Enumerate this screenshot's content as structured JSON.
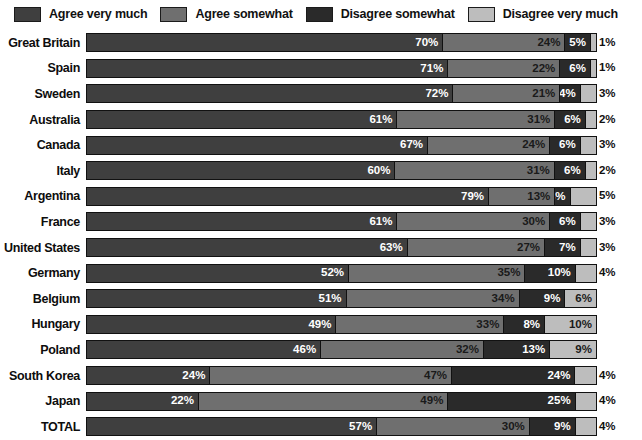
{
  "legend": {
    "items": [
      {
        "label": "Agree very much",
        "color": "#3f3f3f"
      },
      {
        "label": "Agree somewhat",
        "color": "#6f6f6f"
      },
      {
        "label": "Disagree somewhat",
        "color": "#2a2a2a"
      },
      {
        "label": "Disagree very much",
        "color": "#bdbdbd"
      }
    ]
  },
  "chart_data": {
    "type": "bar",
    "subtype": "stacked-horizontal-100",
    "title": "",
    "xlabel": "",
    "ylabel": "",
    "xlim": [
      0,
      100
    ],
    "grid": false,
    "legend_position": "top",
    "value_suffix": "%",
    "categories": [
      "Great Britain",
      "Spain",
      "Sweden",
      "Australia",
      "Canada",
      "Italy",
      "Argentina",
      "France",
      "United States",
      "Germany",
      "Belgium",
      "Hungary",
      "Poland",
      "South Korea",
      "Japan",
      "TOTAL"
    ],
    "series": [
      {
        "name": "Agree very much",
        "color": "#3f3f3f",
        "values": [
          70,
          71,
          72,
          61,
          67,
          60,
          79,
          61,
          63,
          52,
          51,
          49,
          46,
          24,
          22,
          57
        ]
      },
      {
        "name": "Agree somewhat",
        "color": "#6f6f6f",
        "values": [
          24,
          22,
          21,
          31,
          24,
          31,
          13,
          30,
          27,
          35,
          34,
          33,
          32,
          47,
          49,
          30
        ]
      },
      {
        "name": "Disagree somewhat",
        "color": "#2a2a2a",
        "values": [
          5,
          6,
          4,
          6,
          6,
          6,
          3,
          6,
          7,
          10,
          9,
          8,
          13,
          24,
          25,
          9
        ]
      },
      {
        "name": "Disagree very much",
        "color": "#bdbdbd",
        "values": [
          1,
          1,
          3,
          2,
          3,
          2,
          5,
          3,
          3,
          4,
          6,
          10,
          9,
          4,
          4,
          4
        ]
      }
    ],
    "labels": [
      {
        "category": "Great Britain",
        "values": [
          "70%",
          "24%",
          "5%",
          "1%"
        ],
        "outside": [
          false,
          false,
          false,
          true
        ]
      },
      {
        "category": "Spain",
        "values": [
          "71%",
          "22%",
          "6%",
          "1%"
        ],
        "outside": [
          false,
          false,
          false,
          true
        ]
      },
      {
        "category": "Sweden",
        "values": [
          "72%",
          "21%",
          "4%",
          "3%"
        ],
        "outside": [
          false,
          false,
          false,
          true
        ]
      },
      {
        "category": "Australia",
        "values": [
          "61%",
          "31%",
          "6%",
          "2%"
        ],
        "outside": [
          false,
          false,
          false,
          true
        ]
      },
      {
        "category": "Canada",
        "values": [
          "67%",
          "24%",
          "6%",
          "3%"
        ],
        "outside": [
          false,
          false,
          false,
          true
        ]
      },
      {
        "category": "Italy",
        "values": [
          "60%",
          "31%",
          "6%",
          "2%"
        ],
        "outside": [
          false,
          false,
          false,
          true
        ]
      },
      {
        "category": "Argentina",
        "values": [
          "79%",
          "13%",
          "3%",
          "5%"
        ],
        "outside": [
          false,
          false,
          false,
          true
        ]
      },
      {
        "category": "France",
        "values": [
          "61%",
          "30%",
          "6%",
          "3%"
        ],
        "outside": [
          false,
          false,
          false,
          true
        ]
      },
      {
        "category": "United States",
        "values": [
          "63%",
          "27%",
          "7%",
          "3%"
        ],
        "outside": [
          false,
          false,
          false,
          true
        ]
      },
      {
        "category": "Germany",
        "values": [
          "52%",
          "35%",
          "10%",
          "4%"
        ],
        "outside": [
          false,
          false,
          false,
          true
        ]
      },
      {
        "category": "Belgium",
        "values": [
          "51%",
          "34%",
          "9%",
          "6%"
        ],
        "outside": [
          false,
          false,
          false,
          false
        ]
      },
      {
        "category": "Hungary",
        "values": [
          "49%",
          "33%",
          "8%",
          "10%"
        ],
        "outside": [
          false,
          false,
          false,
          false
        ]
      },
      {
        "category": "Poland",
        "values": [
          "46%",
          "32%",
          "13%",
          "9%"
        ],
        "outside": [
          false,
          false,
          false,
          false
        ]
      },
      {
        "category": "South Korea",
        "values": [
          "24%",
          "47%",
          "24%",
          "4%"
        ],
        "outside": [
          false,
          false,
          false,
          true
        ]
      },
      {
        "category": "Japan",
        "values": [
          "22%",
          "49%",
          "25%",
          "4%"
        ],
        "outside": [
          false,
          false,
          false,
          true
        ]
      },
      {
        "category": "TOTAL",
        "values": [
          "57%",
          "30%",
          "9%",
          "4%"
        ],
        "outside": [
          false,
          false,
          false,
          true
        ]
      }
    ]
  }
}
